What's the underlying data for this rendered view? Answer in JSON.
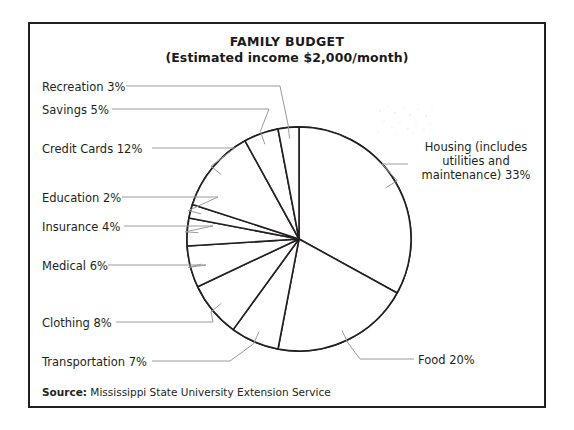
{
  "figure": {
    "title": "FAMILY BUDGET",
    "subtitle": "(Estimated income $2,000/month)",
    "source_label": "Source:",
    "source_text": "Mississippi State University Extension Service"
  },
  "labels": {
    "recreation": "Recreation 3%",
    "savings": "Savings 5%",
    "credit_cards": "Credit Cards 12%",
    "education": "Education 2%",
    "insurance": "Insurance 4%",
    "medical": "Medical 6%",
    "clothing": "Clothing 8%",
    "transportation": "Transportation 7%",
    "food": "Food 20%",
    "housing": "Housing (includes utilities and maintenance) 33%"
  },
  "colors": {
    "frame": "#231f20",
    "pie_outline": "#231f20",
    "pie_fill": "#ffffff",
    "leader_line": "#9a9a9a",
    "text": "#231f20"
  },
  "chart_data": {
    "type": "pie",
    "title": "FAMILY BUDGET",
    "subtitle": "(Estimated income $2,000/month)",
    "units": "percent of monthly income",
    "total": 100,
    "start_angle_deg": 0,
    "direction": "clockwise",
    "legend": "outside-labels-with-leader-lines",
    "grid": false,
    "slices": [
      {
        "name": "Housing (includes utilities and maintenance)",
        "short": "Housing",
        "value": 33,
        "label": "Housing (includes utilities and maintenance) 33%"
      },
      {
        "name": "Food",
        "short": "Food",
        "value": 20,
        "label": "Food 20%"
      },
      {
        "name": "Transportation",
        "short": "Transportation",
        "value": 7,
        "label": "Transportation 7%"
      },
      {
        "name": "Clothing",
        "short": "Clothing",
        "value": 8,
        "label": "Clothing 8%"
      },
      {
        "name": "Medical",
        "short": "Medical",
        "value": 6,
        "label": "Medical 6%"
      },
      {
        "name": "Insurance",
        "short": "Insurance",
        "value": 4,
        "label": "Insurance 4%"
      },
      {
        "name": "Education",
        "short": "Education",
        "value": 2,
        "label": "Education 2%"
      },
      {
        "name": "Credit Cards",
        "short": "Credit Cards",
        "value": 12,
        "label": "Credit Cards 12%"
      },
      {
        "name": "Savings",
        "short": "Savings",
        "value": 5,
        "label": "Savings 5%"
      },
      {
        "name": "Recreation",
        "short": "Recreation",
        "value": 3,
        "label": "Recreation 3%"
      }
    ],
    "source": "Source: Mississippi State University Extension Service"
  }
}
